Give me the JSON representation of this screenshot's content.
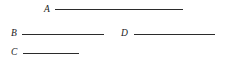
{
  "figure": {
    "type": "line-segment-diagram",
    "background_color": "#ffffff",
    "line_color": "#2b2b2b",
    "label_color": "#1a1a1a",
    "canvas": {
      "width": 227,
      "height": 65
    },
    "segments": [
      {
        "label": "A",
        "label_x": 44,
        "label_y": 5,
        "line_x": 55,
        "line_y": 9,
        "line_length": 128
      },
      {
        "label": "B",
        "label_x": 11,
        "label_y": 29,
        "line_x": 22,
        "line_y": 34,
        "line_length": 82
      },
      {
        "label": "D",
        "label_x": 121,
        "label_y": 29,
        "line_x": 134,
        "line_y": 34,
        "line_length": 81
      },
      {
        "label": "C",
        "label_x": 11,
        "label_y": 48,
        "line_x": 23,
        "line_y": 53,
        "line_length": 56
      }
    ]
  }
}
